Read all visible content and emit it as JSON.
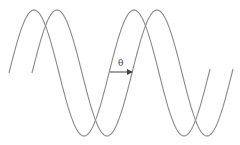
{
  "diagram": {
    "phase_label": "θ",
    "waves": [
      {
        "name": "reference-wave",
        "x_start": 9,
        "x_end": 210,
        "phase_offset_px": 0
      },
      {
        "name": "shifted-wave",
        "x_start": 32,
        "x_end": 233,
        "phase_offset_px": 22
      }
    ],
    "period_px": 100,
    "amplitude_px": 63,
    "center_y": 73,
    "colors": {
      "wave": "#8a8a8a",
      "arrow": "#444444"
    }
  }
}
